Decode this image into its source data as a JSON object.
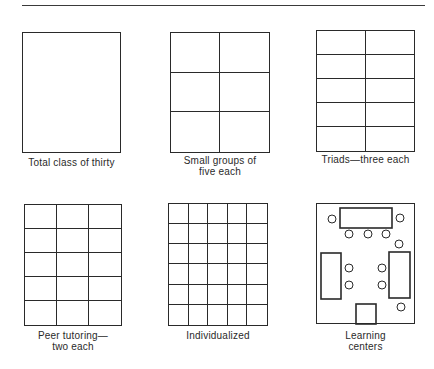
{
  "figure": {
    "panels": [
      {
        "id": "total-class",
        "label_lines": [
          "Total class of thirty"
        ],
        "cols": 1,
        "rows": 1,
        "box": {
          "x": 22,
          "y": 32,
          "w": 99,
          "h": 121
        },
        "label_top": 157
      },
      {
        "id": "small-groups",
        "label_lines": [
          "Small groups of",
          "five each"
        ],
        "cols": 2,
        "rows": 3,
        "box": {
          "x": 170,
          "y": 32,
          "w": 100,
          "h": 121
        },
        "label_top": 155
      },
      {
        "id": "triads",
        "label_lines": [
          "Triads—three each"
        ],
        "cols": 2,
        "rows": 5,
        "box": {
          "x": 316,
          "y": 30,
          "w": 99,
          "h": 122
        },
        "label_top": 154
      },
      {
        "id": "peer-tutoring",
        "label_lines": [
          "Peer tutoring—",
          "two each"
        ],
        "cols": 3,
        "rows": 5,
        "box": {
          "x": 24,
          "y": 204,
          "w": 98,
          "h": 122
        },
        "label_top": 330
      },
      {
        "id": "individualized",
        "label_lines": [
          "Individualized"
        ],
        "cols": 5,
        "rows": 6,
        "box": {
          "x": 168,
          "y": 203,
          "w": 100,
          "h": 123
        },
        "label_top": 330
      },
      {
        "id": "learning-centers",
        "label_lines": [
          "Learning",
          "centers"
        ],
        "cols": 0,
        "rows": 0,
        "box": {
          "x": 316,
          "y": 203,
          "w": 99,
          "h": 121
        },
        "label_top": 330
      }
    ],
    "learning_centers_layout": {
      "tables": [
        {
          "name": "top-table",
          "x": 340,
          "y": 208,
          "w": 52,
          "h": 20
        },
        {
          "name": "left-table",
          "x": 321,
          "y": 253,
          "w": 20,
          "h": 46
        },
        {
          "name": "right-table",
          "x": 389,
          "y": 252,
          "w": 21,
          "h": 46
        },
        {
          "name": "bottom-center-table",
          "x": 356,
          "y": 304,
          "w": 20,
          "h": 20
        }
      ],
      "seats": [
        {
          "cx": 332,
          "cy": 219
        },
        {
          "cx": 400,
          "cy": 218
        },
        {
          "cx": 349,
          "cy": 234
        },
        {
          "cx": 368,
          "cy": 234
        },
        {
          "cx": 386,
          "cy": 234
        },
        {
          "cx": 399,
          "cy": 244
        },
        {
          "cx": 349,
          "cy": 268
        },
        {
          "cx": 349,
          "cy": 285
        },
        {
          "cx": 382,
          "cy": 268
        },
        {
          "cx": 382,
          "cy": 285
        },
        {
          "cx": 401,
          "cy": 307
        }
      ],
      "seat_radius": 4
    },
    "colors": {
      "line": "#2a2a2a",
      "background": "#ffffff",
      "rule": "#3a3a3a"
    }
  }
}
